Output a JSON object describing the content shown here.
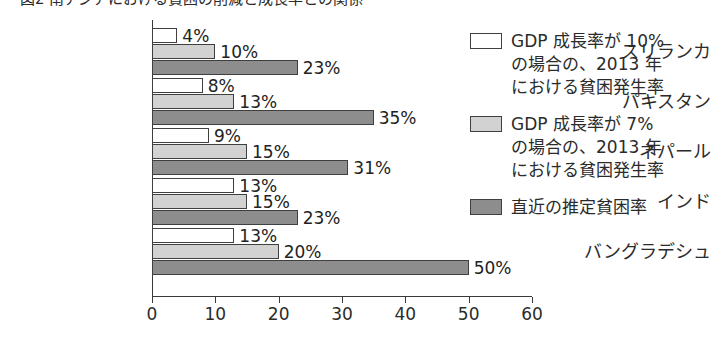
{
  "figure": {
    "title": "図2 南アジアにおける貧困の削減と成長率との関係"
  },
  "chart_data": {
    "type": "bar",
    "orientation": "horizontal",
    "title": "図2 南アジアにおける貧困の削減と成長率との関係",
    "xlabel": "",
    "ylabel": "",
    "xlim": [
      0,
      60
    ],
    "xticks": [
      0,
      10,
      20,
      30,
      40,
      50,
      60
    ],
    "grid": false,
    "legend_position": "right",
    "categories": [
      "スリランカ",
      "パキスタン",
      "ネパール",
      "インド",
      "バングラデシュ"
    ],
    "series": [
      {
        "name": "GDP 成長率が 10% の場合の、2013 年における貧困発生率",
        "color": "#ffffff",
        "values": [
          4,
          8,
          9,
          13,
          13
        ],
        "labels": [
          "4%",
          "8%",
          "9%",
          "13%",
          "13%"
        ]
      },
      {
        "name": "GDP 成長率が 7% の場合の、2013 年における貧困発生率",
        "color": "#d2d2d2",
        "values": [
          10,
          13,
          15,
          15,
          20
        ],
        "labels": [
          "10%",
          "13%",
          "15%",
          "15%",
          "20%"
        ]
      },
      {
        "name": "直近の推定貧困率",
        "color": "#8d8d8d",
        "values": [
          23,
          35,
          31,
          23,
          50
        ],
        "labels": [
          "23%",
          "35%",
          "31%",
          "23%",
          "50%"
        ]
      }
    ]
  },
  "legend": {
    "entries": [
      {
        "swatch": "s0",
        "lines": [
          "GDP 成長率が 10%",
          "の場合の、2013 年",
          "における貧困発生率"
        ]
      },
      {
        "swatch": "s1",
        "lines": [
          "GDP 成長率が 7%",
          "の場合の、2013 年",
          "における貧困発生率"
        ]
      },
      {
        "swatch": "s2",
        "lines": [
          "直近の推定貧困率"
        ]
      }
    ]
  }
}
